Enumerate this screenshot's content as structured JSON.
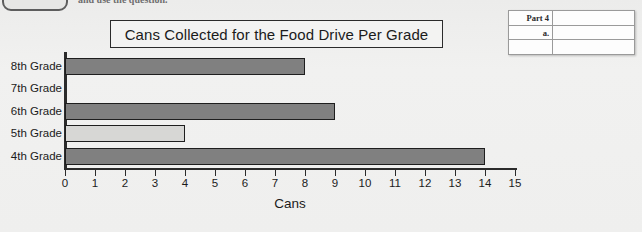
{
  "worksheet": {
    "clipped_instruction": "and use the question.",
    "answer_table": {
      "part_label": "Part 4",
      "item_label": "a."
    }
  },
  "chart_data": {
    "type": "bar",
    "orientation": "horizontal",
    "title": "Cans Collected for the Food Drive Per Grade",
    "xlabel": "Cans",
    "ylabel": "",
    "categories": [
      "8th Grade",
      "7th Grade",
      "6th Grade",
      "5th Grade",
      "4th Grade"
    ],
    "values": [
      8,
      0,
      9,
      4,
      14
    ],
    "xlim": [
      0,
      15
    ],
    "xticks": [
      0,
      1,
      2,
      3,
      4,
      5,
      6,
      7,
      8,
      9,
      10,
      11,
      12,
      13,
      14,
      15
    ],
    "grid": false,
    "legend": null,
    "bar_colors": [
      "#808080",
      "#808080",
      "#808080",
      "#d7d7d5",
      "#808080"
    ],
    "bar_edge_color": "#1e1e1e"
  },
  "colors": {
    "background": "#eeeeec",
    "axis": "#2b2b2b",
    "text": "#1b1b1b",
    "bar_dark": "#808080",
    "bar_light": "#d7d7d5"
  }
}
